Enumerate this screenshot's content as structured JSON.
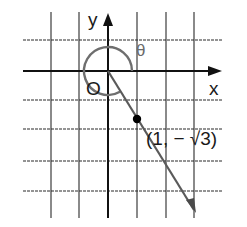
{
  "diagram": {
    "type": "coordinate-plane-angle",
    "axes": {
      "x_label": "x",
      "y_label": "y",
      "origin_label": "O"
    },
    "angle": {
      "label": "θ",
      "description": "reflex angle measured counterclockwise from positive x-axis to terminal ray"
    },
    "point": {
      "label": "(1, − √3)",
      "x_text": "1",
      "y_text": "−√3"
    },
    "colors": {
      "grid": "#2a2a2a",
      "axis": "#111111",
      "arc": "#6e6e6e",
      "ray": "#5a5a5a",
      "point": "#000000"
    },
    "grid": {
      "columns_x_px": [
        51,
        79,
        108,
        137,
        166,
        194
      ],
      "rows_y_px": [
        40,
        71,
        100,
        129,
        161,
        191
      ],
      "origin_px": [
        108,
        71
      ],
      "unit_px": 29
    }
  }
}
